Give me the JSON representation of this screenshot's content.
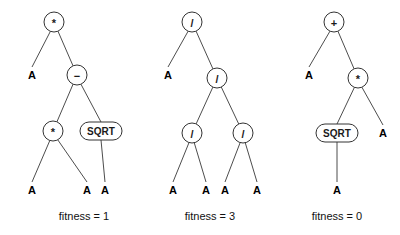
{
  "figure": {
    "background_color": "#ffffff",
    "stroke_color": "#4d4d4d",
    "node_stroke_color": "#333333",
    "text_color": "#000000",
    "width": 400,
    "height": 235
  },
  "trees": [
    {
      "id": "tree-1",
      "caption": "fitness = 1",
      "caption_x": 84,
      "caption_y": 220,
      "nodes": [
        {
          "id": "t1-root",
          "label": "*",
          "shape": "circle",
          "x": 54,
          "y": 22,
          "r": 10
        },
        {
          "id": "t1-leafA",
          "label": "A",
          "shape": "text",
          "x": 32,
          "y": 79
        },
        {
          "id": "t1-minus",
          "label": "−",
          "shape": "circle",
          "x": 77,
          "y": 75,
          "r": 10
        },
        {
          "id": "t1-mul2",
          "label": "*",
          "shape": "circle",
          "x": 53,
          "y": 131,
          "r": 10
        },
        {
          "id": "t1-sqrt",
          "label": "SQRT",
          "shape": "pill",
          "x": 101,
          "y": 131,
          "w": 42,
          "h": 18
        },
        {
          "id": "t1-leafB",
          "label": "A",
          "shape": "text",
          "x": 32,
          "y": 194
        },
        {
          "id": "t1-leafC",
          "label": "A",
          "shape": "text",
          "x": 87,
          "y": 194
        },
        {
          "id": "t1-leafD",
          "label": "A",
          "shape": "text",
          "x": 105,
          "y": 194
        }
      ],
      "edges": [
        {
          "from": "t1-root",
          "to": "t1-leafA"
        },
        {
          "from": "t1-root",
          "to": "t1-minus"
        },
        {
          "from": "t1-minus",
          "to": "t1-mul2"
        },
        {
          "from": "t1-minus",
          "to": "t1-sqrt"
        },
        {
          "from": "t1-mul2",
          "to": "t1-leafB"
        },
        {
          "from": "t1-mul2",
          "to": "t1-leafC"
        },
        {
          "from": "t1-sqrt",
          "to": "t1-leafD"
        }
      ]
    },
    {
      "id": "tree-2",
      "caption": "fitness = 3",
      "caption_x": 210,
      "caption_y": 220,
      "nodes": [
        {
          "id": "t2-root",
          "label": "/",
          "shape": "circle",
          "x": 192,
          "y": 22,
          "r": 10
        },
        {
          "id": "t2-leafA",
          "label": "A",
          "shape": "text",
          "x": 168,
          "y": 79
        },
        {
          "id": "t2-div2",
          "label": "/",
          "shape": "circle",
          "x": 217,
          "y": 78,
          "r": 10
        },
        {
          "id": "t2-div3",
          "label": "/",
          "shape": "circle",
          "x": 192,
          "y": 133,
          "r": 10
        },
        {
          "id": "t2-div4",
          "label": "/",
          "shape": "circle",
          "x": 243,
          "y": 133,
          "r": 10
        },
        {
          "id": "t2-leafB",
          "label": "A",
          "shape": "text",
          "x": 173,
          "y": 194
        },
        {
          "id": "t2-leafC",
          "label": "A",
          "shape": "text",
          "x": 206,
          "y": 194
        },
        {
          "id": "t2-leafD",
          "label": "A",
          "shape": "text",
          "x": 225,
          "y": 194
        },
        {
          "id": "t2-leafE",
          "label": "A",
          "shape": "text",
          "x": 257,
          "y": 194
        }
      ],
      "edges": [
        {
          "from": "t2-root",
          "to": "t2-leafA"
        },
        {
          "from": "t2-root",
          "to": "t2-div2"
        },
        {
          "from": "t2-div2",
          "to": "t2-div3"
        },
        {
          "from": "t2-div2",
          "to": "t2-div4"
        },
        {
          "from": "t2-div3",
          "to": "t2-leafB"
        },
        {
          "from": "t2-div3",
          "to": "t2-leafC"
        },
        {
          "from": "t2-div4",
          "to": "t2-leafD"
        },
        {
          "from": "t2-div4",
          "to": "t2-leafE"
        }
      ]
    },
    {
      "id": "tree-3",
      "caption": "fitness = 0",
      "caption_x": 337,
      "caption_y": 220,
      "nodes": [
        {
          "id": "t3-root",
          "label": "+",
          "shape": "circle",
          "x": 334,
          "y": 22,
          "r": 10
        },
        {
          "id": "t3-leafA",
          "label": "A",
          "shape": "text",
          "x": 309,
          "y": 79
        },
        {
          "id": "t3-mul",
          "label": "*",
          "shape": "circle",
          "x": 358,
          "y": 78,
          "r": 10
        },
        {
          "id": "t3-sqrt",
          "label": "SQRT",
          "shape": "pill",
          "x": 337,
          "y": 133,
          "w": 42,
          "h": 18
        },
        {
          "id": "t3-leafB",
          "label": "A",
          "shape": "text",
          "x": 383,
          "y": 137
        },
        {
          "id": "t3-leafC",
          "label": "A",
          "shape": "text",
          "x": 337,
          "y": 194
        }
      ],
      "edges": [
        {
          "from": "t3-root",
          "to": "t3-leafA"
        },
        {
          "from": "t3-root",
          "to": "t3-mul"
        },
        {
          "from": "t3-mul",
          "to": "t3-sqrt"
        },
        {
          "from": "t3-mul",
          "to": "t3-leafB"
        },
        {
          "from": "t3-sqrt",
          "to": "t3-leafC"
        }
      ]
    }
  ]
}
